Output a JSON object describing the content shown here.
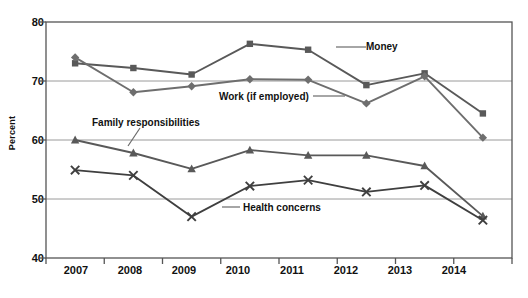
{
  "chart_data": {
    "type": "line",
    "title": "",
    "xlabel": "",
    "ylabel": "Percent",
    "ylim": [
      40,
      80
    ],
    "yticks": [
      40,
      50,
      60,
      70,
      80
    ],
    "grid": true,
    "legend_position": "inline-annotations",
    "categories": [
      "2007",
      "2008",
      "2009",
      "2010",
      "2011",
      "2012",
      "2013",
      "2014"
    ],
    "series": [
      {
        "name": "Money",
        "marker": "square",
        "color": "#595959",
        "values": [
          73.0,
          72.2,
          71.1,
          76.3,
          75.3,
          69.3,
          71.3,
          64.5
        ]
      },
      {
        "name": "Work (if employed)",
        "marker": "diamond",
        "color": "#6e6e6e",
        "values": [
          74.0,
          68.1,
          69.1,
          70.3,
          70.2,
          66.2,
          70.8,
          60.4
        ]
      },
      {
        "name": "Family responsibilities",
        "marker": "triangle",
        "color": "#595959",
        "values": [
          60.0,
          57.8,
          55.1,
          58.3,
          57.4,
          57.4,
          55.6,
          47.1
        ]
      },
      {
        "name": "Health concerns",
        "marker": "cross",
        "color": "#3f3f3f",
        "values": [
          54.9,
          54.0,
          47.0,
          52.2,
          53.2,
          51.2,
          52.3,
          46.4
        ]
      }
    ]
  },
  "axis": {
    "ylabel": "Percent",
    "yticks": [
      "80",
      "70",
      "60",
      "50",
      "40"
    ],
    "xticks": [
      "2007",
      "2008",
      "2009",
      "2010",
      "2011",
      "2012",
      "2013",
      "2014"
    ]
  },
  "annotations": [
    {
      "label": "Money"
    },
    {
      "label": "Work (if employed)"
    },
    {
      "label": "Family responsibilities"
    },
    {
      "label": "Health concerns"
    }
  ],
  "colors": {
    "line_dark": "#595959",
    "line_mid": "#6e6e6e",
    "grid": "#9a9a9a",
    "axis": "#555555",
    "text": "#111111",
    "background": "#ffffff"
  }
}
